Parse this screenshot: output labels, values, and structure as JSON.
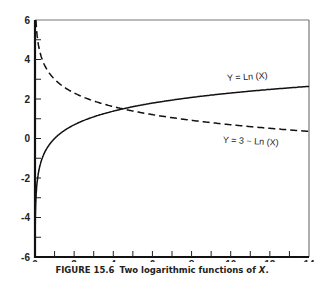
{
  "chart_data": {
    "type": "line",
    "title": "",
    "xlabel": "",
    "ylabel": "",
    "xlim": [
      0,
      14
    ],
    "ylim": [
      -6,
      6
    ],
    "x_ticks": [
      0,
      2,
      4,
      6,
      8,
      10,
      12,
      14
    ],
    "y_ticks": [
      -6,
      -4,
      -2,
      0,
      2,
      4,
      6
    ],
    "x_minor_step": 1,
    "y_minor_step": 1,
    "grid": false,
    "legend": null,
    "series": [
      {
        "name": "Y = Ln (X)",
        "style": "solid",
        "x": [
          0.003,
          0.05,
          0.1,
          0.25,
          0.5,
          1,
          2,
          3,
          4,
          4.48,
          6,
          8,
          10,
          12,
          14
        ],
        "values": [
          -5.8,
          -3.0,
          -2.3,
          -1.39,
          -0.69,
          0,
          0.69,
          1.1,
          1.39,
          1.5,
          1.79,
          2.08,
          2.3,
          2.48,
          2.64
        ]
      },
      {
        "name": "Y = 3 − Ln (X)",
        "style": "dashed",
        "x": [
          0.003,
          0.05,
          0.1,
          0.25,
          0.5,
          1,
          2,
          3,
          4,
          4.48,
          6,
          8,
          10,
          12,
          14
        ],
        "values": [
          5.8,
          6.0,
          5.3,
          4.39,
          3.69,
          3,
          2.31,
          1.9,
          1.61,
          1.5,
          1.21,
          0.92,
          0.7,
          0.52,
          0.36
        ]
      }
    ],
    "annotations": [
      {
        "text": "Y = Ln (X)",
        "x": 10.5,
        "y": 3.1
      },
      {
        "text": "Y = 3 − Ln (X)",
        "x": 10.5,
        "y": -0.2
      }
    ]
  },
  "caption": {
    "figure_number": "FIGURE 15.6",
    "text_before": "Two logarithmic functions of ",
    "variable": "X",
    "text_after": "."
  }
}
